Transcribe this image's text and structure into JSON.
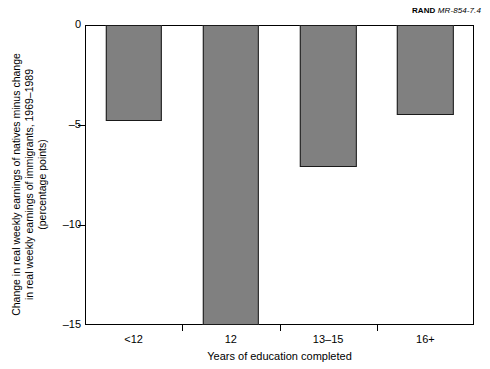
{
  "credit": {
    "organization": "RAND",
    "document_number": "MR-854-7.4"
  },
  "chart_data": {
    "type": "bar",
    "title": "",
    "subtitle": "",
    "categories": [
      "<12",
      "12",
      "13–15",
      "16+"
    ],
    "values": [
      -4.8,
      -15.0,
      -7.1,
      -4.5
    ],
    "series": [
      {
        "name": "Change in real weekly earnings of natives minus change in real weekly earnings of immigrants, 1969-1989",
        "values": [
          -4.8,
          -15.0,
          -7.1,
          -4.5
        ]
      }
    ],
    "xlabel": "Years of education completed",
    "ylabel": "Change in real weekly earnings of natives minus change in real weekly earnings of immigrants, 1969–1989 (percentage points)",
    "ylabel_lines": [
      "Change in real weekly earnings of natives minus change",
      "in real weekly earnings of immigrants, 1969–1989",
      "(percentage points)"
    ],
    "ylim": [
      -15,
      0
    ],
    "yticks": [
      0,
      -5,
      -10,
      -15
    ],
    "ytick_labels": [
      "0",
      "–5",
      "–10",
      "–15"
    ],
    "grid": false,
    "legend": "none",
    "bar_color": "#808080",
    "bar_edge_color": "#1a1a1a",
    "axis_color": "#000000",
    "background_color": "#ffffff"
  }
}
